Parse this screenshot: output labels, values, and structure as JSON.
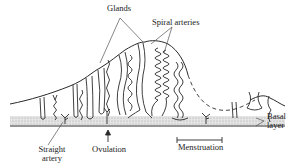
{
  "diagram": {
    "labels": {
      "glands": "Glands",
      "spiral_arteries": "Spiral arteries",
      "straight_artery_line1": "Straight",
      "straight_artery_line2": "artery",
      "ovulation": "Ovulation",
      "menstruation": "Menstruation",
      "basal_layer_line1": "Basal",
      "basal_layer_line2": "layer"
    },
    "colors": {
      "line": "#2a2a2a",
      "basal_fill": "#d9d9d9",
      "leader": "#555555"
    }
  }
}
